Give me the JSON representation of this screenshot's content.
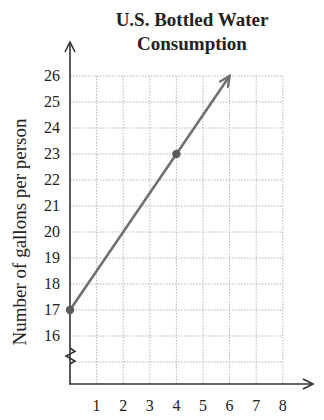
{
  "chart_data": {
    "type": "line",
    "title": "U.S. Bottled Water Consumption",
    "title_lines": [
      "U.S. Bottled Water",
      "Consumption"
    ],
    "xlabel": "",
    "ylabel": "Number of gallons per person",
    "x_ticks": [
      1,
      2,
      3,
      4,
      5,
      6,
      7,
      8
    ],
    "y_ticks": [
      16,
      17,
      18,
      19,
      20,
      21,
      22,
      23,
      24,
      25,
      26
    ],
    "xlim": [
      0,
      8
    ],
    "ylim": [
      14,
      26
    ],
    "y_axis_break": true,
    "grid": true,
    "series": [
      {
        "name": "Consumption",
        "points": [
          {
            "x": 0,
            "y": 17
          },
          {
            "x": 4,
            "y": 23
          }
        ],
        "line_extends_to": {
          "x": 6,
          "y": 26
        },
        "arrow_end": true,
        "color": "#707070"
      }
    ],
    "legend": null
  }
}
